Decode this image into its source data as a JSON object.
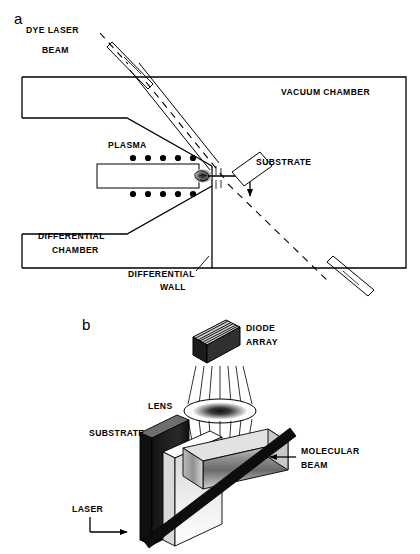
{
  "figure": {
    "panels": [
      {
        "letter": "a",
        "name": "vacuum-chamber-cross-section",
        "labels": {
          "dye_laser_line1": "DYE LASER",
          "dye_laser_line2": "BEAM",
          "vacuum_chamber": "VACUUM CHAMBER",
          "plasma": "PLASMA",
          "substrate": "SUBSTRATE",
          "differential_chamber_line1": "DIFFERENTIAL",
          "differential_chamber_line2": "CHAMBER",
          "differential_wall_line1": "DIFFERENTIAL",
          "differential_wall_line2": "WALL"
        },
        "plasma_coil_dots": {
          "top_row_count": 5,
          "bottom_row_count": 5
        }
      },
      {
        "letter": "b",
        "name": "detection-geometry-perspective",
        "labels": {
          "diode_array_line1": "DIODE",
          "diode_array_line2": "ARRAY",
          "lens": "LENS",
          "substrate": "SUBSTRATE",
          "molecular_beam_line1": "MOLECULAR",
          "molecular_beam_line2": "BEAM",
          "laser": "LASER"
        },
        "ray_counts": {
          "converging_rays_above_lens": 7,
          "diverging_rays_below_lens": 7
        }
      }
    ],
    "colors": {
      "line": "#000000",
      "background": "#ffffff",
      "dark_slab": "#1a1a1a",
      "mid_slab": "#7a7a7a",
      "light_slab": "#f2f2f2"
    }
  }
}
